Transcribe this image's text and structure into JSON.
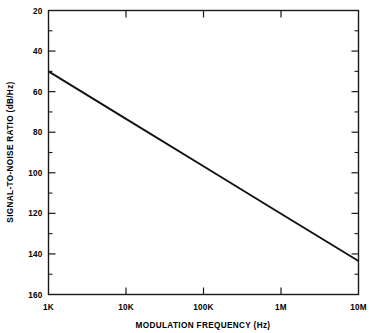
{
  "chart_data": {
    "type": "line",
    "title": "",
    "xlabel": "MODULATION FREQUENCY (Hz)",
    "ylabel": "SIGNAL-TO-NOISE RATIO (dB/Hz)",
    "xscale": "log",
    "yscale": "linear",
    "xlim": [
      1000,
      10000000
    ],
    "ylim": [
      20,
      160
    ],
    "y_inverted": true,
    "grid": false,
    "legend": null,
    "x_tick_labels": [
      "1K",
      "10K",
      "100K",
      "1M",
      "10M"
    ],
    "x_tick_values": [
      1000,
      10000,
      100000,
      1000000,
      10000000
    ],
    "y_tick_labels": [
      "20",
      "40",
      "60",
      "80",
      "100",
      "120",
      "140",
      "160"
    ],
    "y_tick_values": [
      20,
      40,
      60,
      80,
      100,
      120,
      140,
      160
    ],
    "y_minor_tick_values": [
      30,
      50,
      70,
      90,
      110,
      130,
      150
    ],
    "series": [
      {
        "name": "signal-to-noise ratio",
        "x": [
          1000,
          10000,
          100000,
          1000000,
          10000000
        ],
        "y": [
          50.0,
          73.4,
          96.8,
          120.2,
          143.5
        ]
      }
    ],
    "annotations": []
  },
  "axis": {
    "x_title": "MODULATION FREQUENCY (Hz)",
    "y_title": "SIGNAL-TO-NOISE RATIO (dB/Hz)"
  },
  "ticks": {
    "x": [
      {
        "label": "1K",
        "value": 1000
      },
      {
        "label": "10K",
        "value": 10000
      },
      {
        "label": "100K",
        "value": 100000
      },
      {
        "label": "1M",
        "value": 1000000
      },
      {
        "label": "10M",
        "value": 10000000
      }
    ],
    "y": [
      {
        "label": "20",
        "value": 20
      },
      {
        "label": "40",
        "value": 40
      },
      {
        "label": "60",
        "value": 60
      },
      {
        "label": "80",
        "value": 80
      },
      {
        "label": "100",
        "value": 100
      },
      {
        "label": "120",
        "value": 120
      },
      {
        "label": "140",
        "value": 140
      },
      {
        "label": "160",
        "value": 160
      }
    ]
  },
  "colors": {
    "background": "#ffffff",
    "axis": "#1a1a1a",
    "line": "#111111",
    "text": "#000000"
  }
}
